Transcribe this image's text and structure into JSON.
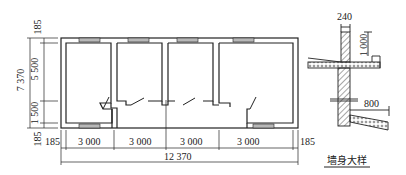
{
  "plan": {
    "horizontal_dims": [
      "185",
      "3 000",
      "3 000",
      "3 000",
      "3 000",
      "185"
    ],
    "total_width": "12 370",
    "vertical_dims": {
      "top": "185",
      "upper": "5 500",
      "lower": "1 500",
      "bottom": "185",
      "total": "7 370"
    }
  },
  "detail": {
    "wall_thickness": "240",
    "parapet_height": "1 000",
    "canopy_length": "800",
    "caption": "墙身大样"
  },
  "colors": {
    "line": "#222222",
    "window_fill": "#b8b8b8",
    "background": "#ffffff"
  }
}
